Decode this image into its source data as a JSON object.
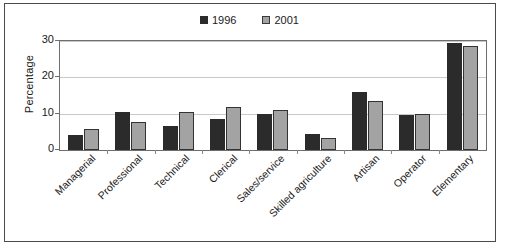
{
  "chart_data": {
    "type": "bar",
    "title": "",
    "xlabel": "",
    "ylabel": "Percentage",
    "ylim": [
      0,
      30
    ],
    "yticks": [
      0,
      10,
      20,
      30
    ],
    "grid": true,
    "legend_position": "top-center",
    "categories": [
      "Managerial",
      "Professional",
      "Technical",
      "Clerical",
      "Sales/service",
      "Skilled agriculture",
      "Artisan",
      "Operator",
      "Elementary"
    ],
    "series": [
      {
        "name": "1996",
        "color": "#2b2b2b",
        "values": [
          4.2,
          10.4,
          6.7,
          8.6,
          10.0,
          4.4,
          16.0,
          9.6,
          29.4
        ]
      },
      {
        "name": "2001",
        "color": "#a3a3a3",
        "values": [
          5.9,
          7.7,
          10.5,
          11.8,
          11.1,
          3.3,
          13.4,
          9.8,
          28.7
        ]
      }
    ]
  },
  "legend": {
    "entries": [
      {
        "label": "1996"
      },
      {
        "label": "2001"
      }
    ]
  },
  "axes": {
    "y_title": "Percentage",
    "y_tick_labels": [
      "30",
      "20",
      "10",
      "0"
    ]
  },
  "colors": {
    "series_1996": "#2b2b2b",
    "series_2001": "#a3a3a3",
    "gridline": "#c9c9c9",
    "frame": "#6e6e6e",
    "outer_border": "#4a4a4a",
    "background": "#ffffff",
    "text": "#1a1a1a"
  }
}
